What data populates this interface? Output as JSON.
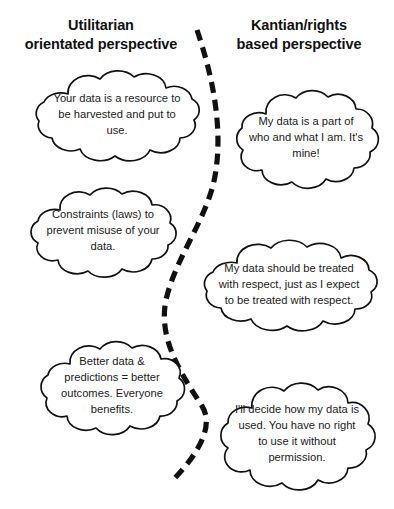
{
  "diagram": {
    "title_left": "Utilitarian orientated perspective",
    "title_right": "Kantian/rights based perspective",
    "headings": {
      "left": "Utilitarian\norientated perspective",
      "right": "Kantian/rights\nbased perspective"
    },
    "divider": {
      "name": "dashed-dividing-line",
      "style": "dashed",
      "color": "#111111",
      "stroke_width": 5,
      "dash": "11 7"
    },
    "colors": {
      "background": "#ffffff",
      "outline": "#111111",
      "text": "#1a1a1a"
    },
    "clouds": [
      {
        "side": "left",
        "index": 1,
        "text": "Your data is a resource to be harvested and put to use."
      },
      {
        "side": "right",
        "index": 1,
        "text": "My data is a part of who and what I am. It's mine!"
      },
      {
        "side": "left",
        "index": 2,
        "text": "Constraints (laws) to prevent misuse of your data."
      },
      {
        "side": "right",
        "index": 2,
        "text": "My data should be treated with respect, just as I expect to be treated with respect."
      },
      {
        "side": "left",
        "index": 3,
        "text": "Better data & predictions = better outcomes. Everyone benefits."
      },
      {
        "side": "right",
        "index": 3,
        "text": "I'll decide how my data is used. You have no right to use it without permission."
      }
    ]
  }
}
